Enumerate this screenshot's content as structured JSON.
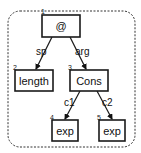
{
  "diagram": {
    "type": "tree",
    "nodes": [
      {
        "id": "1",
        "label": "@"
      },
      {
        "id": "2",
        "label": "length"
      },
      {
        "id": "3",
        "label": "Cons"
      },
      {
        "id": "4",
        "label": "exp"
      },
      {
        "id": "5",
        "label": "exp"
      }
    ],
    "edges": [
      {
        "from": "1",
        "to": "2",
        "label": "sp"
      },
      {
        "from": "1",
        "to": "3",
        "label": "arg"
      },
      {
        "from": "3",
        "to": "4",
        "label": "c1"
      },
      {
        "from": "3",
        "to": "5",
        "label": "c2"
      }
    ]
  }
}
